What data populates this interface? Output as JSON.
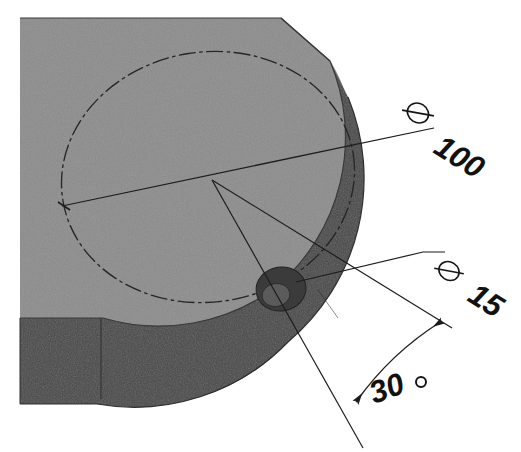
{
  "drawing": {
    "title": "Isometric sectioned disc with angular hole placement",
    "type": "engineering-drawing",
    "background_color": "#ffffff",
    "colors": {
      "top_face": "#8c8c8c",
      "top_face_edge": "#7f7f7f",
      "side_wall": "#4a4a4a",
      "side_wall_dark": "#434343",
      "hole_dark": "#3d3d3d",
      "hole_inner": "#6e6e6e",
      "line": "#1a1a1a",
      "text": "#111111"
    },
    "annotations": [
      {
        "id": "dia-100",
        "name": "diameter-100",
        "symbol": "⌀",
        "value": "100",
        "label": "⌀ 100",
        "kind": "diameter",
        "target": "bolt-circle",
        "text_rotation_deg": 32,
        "text_x": 432,
        "text_y": 150
      },
      {
        "id": "dia-15",
        "name": "diameter-15",
        "symbol": "⌀",
        "value": "15",
        "label": "⌀ 15",
        "kind": "diameter",
        "target": "small-hole",
        "text_rotation_deg": 32,
        "text_x": 462,
        "text_y": 295
      },
      {
        "id": "angle-30",
        "name": "angle-30-degrees",
        "symbol": "°",
        "value": "30",
        "label": "30°",
        "kind": "angle",
        "target": "hole-angular-position",
        "text_rotation_deg": -20,
        "text_x": 383,
        "text_y": 398
      }
    ],
    "features": [
      {
        "name": "top-face",
        "description": "flat upper surface of the disc",
        "shading": "mid-gray"
      },
      {
        "name": "outer-cylindrical-wall",
        "description": "dark curved side wall of the disc",
        "shading": "dark-gray"
      },
      {
        "name": "bolt-circle",
        "description": "dash-dot construction circle of diameter 100",
        "linetype": "dash-dot"
      },
      {
        "name": "small-hole",
        "description": "through hole of diameter 15 located on the bolt circle",
        "shading": "dark"
      },
      {
        "name": "centre-point",
        "description": "convergence of the diameter line and the two angular legs"
      }
    ],
    "linetypes": {
      "centreline": "dash-dot",
      "visible_edge": "solid",
      "dimension": "solid-thin"
    }
  }
}
